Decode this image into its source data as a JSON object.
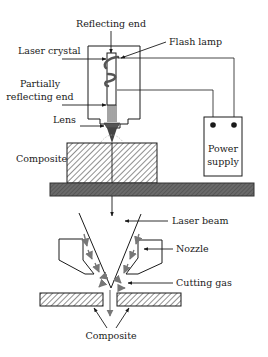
{
  "diagram": {
    "labels": {
      "reflecting_end": "Reflecting end",
      "flash_lamp": "Flash lamp",
      "laser_crystal": "Laser crystal",
      "partially_line1": "Partially",
      "partially_line2": "reflecting end",
      "lens": "Lens",
      "composite_top": "Composite",
      "power_line1": "Power",
      "power_line2": "supply",
      "laser_beam": "Laser beam",
      "nozzle": "Nozzle",
      "cutting_gas": "Cutting gas",
      "composite_bottom": "Composite"
    },
    "colors": {
      "line": "#1a1a1a",
      "base": "#5a5a5a",
      "gas_arrows": "#777777",
      "hatch": "#333333"
    }
  }
}
